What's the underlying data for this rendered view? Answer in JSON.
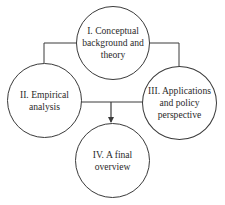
{
  "diagram": {
    "type": "concept-flow",
    "colors": {
      "stroke": "#3a3a3a",
      "text": "#2a2a2a",
      "background": "#ffffff"
    },
    "nodes": [
      {
        "id": "I",
        "label": "I. Conceptual\nbackground and\ntheory"
      },
      {
        "id": "II",
        "label": "II. Empirical\nanalysis"
      },
      {
        "id": "III",
        "label": "III. Applications\nand policy\nperspective"
      },
      {
        "id": "IV",
        "label": "IV. A final\noverview"
      }
    ],
    "edges": [
      {
        "from": "I",
        "to": "II",
        "style": "elbow-line"
      },
      {
        "from": "I",
        "to": "III",
        "style": "elbow-line"
      },
      {
        "from": "II",
        "to": "III",
        "style": "straight-line"
      },
      {
        "from": "II+III",
        "to": "IV",
        "style": "arrow"
      }
    ]
  }
}
